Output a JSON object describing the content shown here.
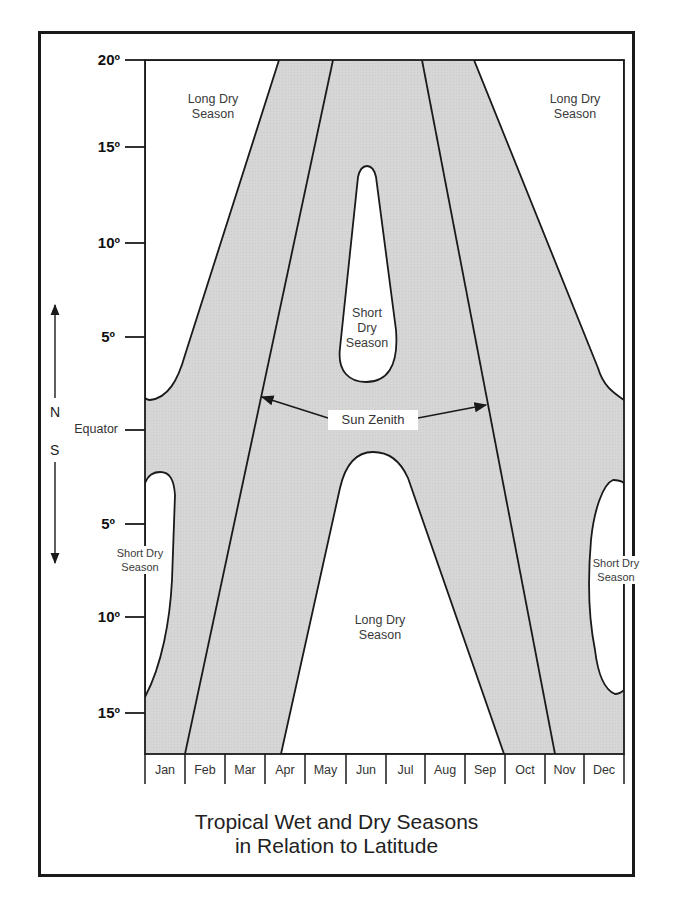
{
  "title": {
    "line1": "Tropical Wet and Dry Seasons",
    "line2": "in Relation to Latitude"
  },
  "y_axis": {
    "ticks": [
      {
        "label": "20º",
        "y": 60
      },
      {
        "label": "15º",
        "y": 147
      },
      {
        "label": "10º",
        "y": 243
      },
      {
        "label": "5º",
        "y": 337
      },
      {
        "label": "Equator",
        "y": 430
      },
      {
        "label": "5º",
        "y": 524
      },
      {
        "label": "10º",
        "y": 617
      },
      {
        "label": "15º",
        "y": 713
      }
    ],
    "north_label": "N",
    "south_label": "S"
  },
  "x_axis": {
    "months": [
      "Jan",
      "Feb",
      "Mar",
      "Apr",
      "May",
      "Jun",
      "Jul",
      "Aug",
      "Sep",
      "Oct",
      "Nov",
      "Dec"
    ]
  },
  "regions": {
    "long_dry_nw": "Long Dry Season",
    "long_dry_ne": "Long Dry Season",
    "short_dry_center": "Short Dry Season",
    "long_dry_south": "Long Dry Season",
    "short_dry_sw": "Short Dry Season",
    "short_dry_se": "Short Dry Season"
  },
  "annotations": {
    "sun_zenith": "Sun Zenith"
  },
  "colors": {
    "wet_season_fill": "#d9d9d9",
    "dry_season_fill": "#ffffff",
    "line": "#1a1a1a"
  },
  "legend_semantics": {
    "shaded": "Wet season",
    "white": "Dry season"
  }
}
